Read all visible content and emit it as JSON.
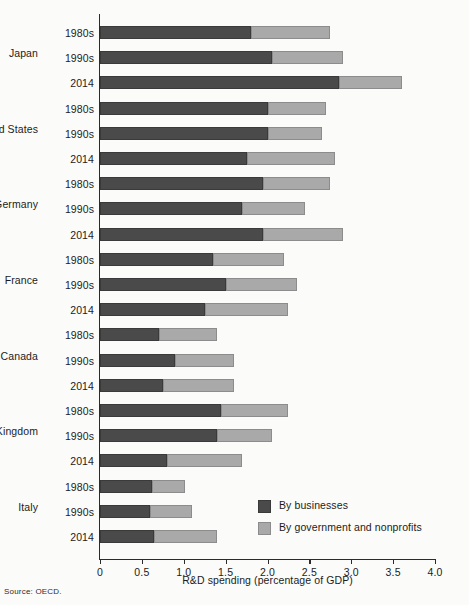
{
  "figure": {
    "source_note": "Source: OECD.",
    "colors": {
      "businesses": "#4a4a4a",
      "government_nonprofits": "#a9a9a9",
      "axis": "#2b2b2b",
      "background": "#fbfbf9"
    }
  },
  "legend": {
    "position": "inside-bottom-right",
    "entries": [
      {
        "label": "By businesses",
        "color": "#4a4a4a",
        "key": "businesses"
      },
      {
        "label": "By government and nonprofits",
        "color": "#a9a9a9",
        "key": "government_nonprofits"
      }
    ]
  },
  "chart_data": {
    "type": "bar",
    "orientation": "horizontal",
    "stacked": true,
    "title": "",
    "subtitle": "",
    "xlabel": "R&D spending (percentage of GDP)",
    "ylabel": "",
    "xlim": [
      0,
      4.0
    ],
    "xticks": [
      0,
      0.5,
      1.0,
      1.5,
      2.0,
      2.5,
      3.0,
      3.5,
      4.0
    ],
    "xticklabels": [
      "0",
      "0.5",
      "1.0",
      "1.5",
      "2.0",
      "2.5",
      "3.0",
      "3.5",
      "4.0"
    ],
    "grid": false,
    "legend_entries": [
      "By businesses",
      "By government and nonprofits"
    ],
    "series": [
      {
        "name": "By businesses",
        "color": "#4a4a4a",
        "values": [
          1.8,
          2.05,
          2.85,
          2.0,
          2.0,
          1.75,
          1.95,
          1.7,
          1.95,
          1.35,
          1.5,
          1.25,
          0.7,
          0.9,
          0.75,
          1.45,
          1.4,
          0.8,
          0.62,
          0.6,
          0.65
        ]
      },
      {
        "name": "By government and nonprofits",
        "color": "#a9a9a9",
        "values": [
          0.95,
          0.85,
          0.75,
          0.7,
          0.65,
          1.05,
          0.8,
          0.75,
          0.95,
          0.85,
          0.85,
          1.0,
          0.7,
          0.7,
          0.85,
          0.8,
          0.65,
          0.9,
          0.4,
          0.5,
          0.75
        ]
      }
    ],
    "groups": [
      {
        "country": "Japan",
        "rows": [
          {
            "period": "1980s",
            "businesses": 1.8,
            "government_nonprofits": 0.95,
            "total": 2.75
          },
          {
            "period": "1990s",
            "businesses": 2.05,
            "government_nonprofits": 0.85,
            "total": 2.9
          },
          {
            "period": "2014",
            "businesses": 2.85,
            "government_nonprofits": 0.75,
            "total": 3.6
          }
        ]
      },
      {
        "country": "United States",
        "rows": [
          {
            "period": "1980s",
            "businesses": 2.0,
            "government_nonprofits": 0.7,
            "total": 2.7
          },
          {
            "period": "1990s",
            "businesses": 2.0,
            "government_nonprofits": 0.65,
            "total": 2.65
          },
          {
            "period": "2014",
            "businesses": 1.75,
            "government_nonprofits": 1.05,
            "total": 2.8
          }
        ]
      },
      {
        "country": "Germany",
        "rows": [
          {
            "period": "1980s",
            "businesses": 1.95,
            "government_nonprofits": 0.8,
            "total": 2.75
          },
          {
            "period": "1990s",
            "businesses": 1.7,
            "government_nonprofits": 0.75,
            "total": 2.45
          },
          {
            "period": "2014",
            "businesses": 1.95,
            "government_nonprofits": 0.95,
            "total": 2.9
          }
        ]
      },
      {
        "country": "France",
        "rows": [
          {
            "period": "1980s",
            "businesses": 1.35,
            "government_nonprofits": 0.85,
            "total": 2.2
          },
          {
            "period": "1990s",
            "businesses": 1.5,
            "government_nonprofits": 0.85,
            "total": 2.35
          },
          {
            "period": "2014",
            "businesses": 1.25,
            "government_nonprofits": 1.0,
            "total": 2.25
          }
        ]
      },
      {
        "country": "Canada",
        "rows": [
          {
            "period": "1980s",
            "businesses": 0.7,
            "government_nonprofits": 0.7,
            "total": 1.4
          },
          {
            "period": "1990s",
            "businesses": 0.9,
            "government_nonprofits": 0.7,
            "total": 1.6
          },
          {
            "period": "2014",
            "businesses": 0.75,
            "government_nonprofits": 0.85,
            "total": 1.6
          }
        ]
      },
      {
        "country": "United Kingdom",
        "rows": [
          {
            "period": "1980s",
            "businesses": 1.45,
            "government_nonprofits": 0.8,
            "total": 2.25
          },
          {
            "period": "1990s",
            "businesses": 1.4,
            "government_nonprofits": 0.65,
            "total": 2.05
          },
          {
            "period": "2014",
            "businesses": 0.8,
            "government_nonprofits": 0.9,
            "total": 1.7
          }
        ]
      },
      {
        "country": "Italy",
        "rows": [
          {
            "period": "1980s",
            "businesses": 0.62,
            "government_nonprofits": 0.4,
            "total": 1.02
          },
          {
            "period": "1990s",
            "businesses": 0.6,
            "government_nonprofits": 0.5,
            "total": 1.1
          },
          {
            "period": "2014",
            "businesses": 0.65,
            "government_nonprofits": 0.75,
            "total": 1.4
          }
        ]
      }
    ]
  }
}
